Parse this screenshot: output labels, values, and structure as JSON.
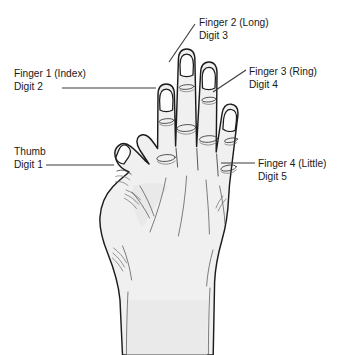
{
  "diagram": {
    "background_color": "#ffffff",
    "skin_fill_color": "#f0f0f0",
    "outline_color": "#1c1c1c",
    "leader_line_color": "#3a3a3a",
    "text_color": "#1a1a1a"
  },
  "labels": [
    {
      "id": "finger-2",
      "line1": "Finger 2 (Long)",
      "line2": "Digit 3",
      "leader": "diagonal"
    },
    {
      "id": "finger-1",
      "line1": "Finger 1 (Index)",
      "line2": "Digit 2",
      "leader": "horizontal"
    },
    {
      "id": "finger-3",
      "line1": "Finger 3 (Ring)",
      "line2": "Digit 4",
      "leader": "diagonal"
    },
    {
      "id": "thumb",
      "line1": "Thumb",
      "line2": "Digit 1",
      "leader": "horizontal"
    },
    {
      "id": "finger-4",
      "line1": "Finger 4 (Little)",
      "line2": "Digit 5",
      "leader": "horizontal"
    }
  ]
}
